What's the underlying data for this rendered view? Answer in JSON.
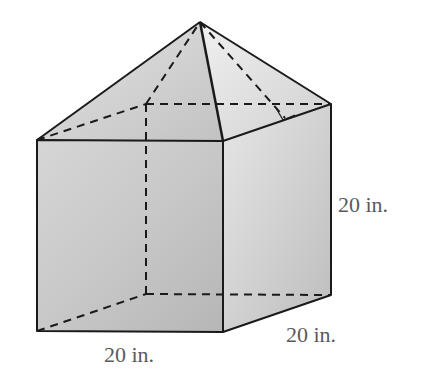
{
  "figure": {
    "labels": {
      "height": "20 in.",
      "depth": "20 in.",
      "width": "20 in."
    },
    "colors": {
      "edge": "#1a1a1a",
      "label": "#5a5a5a"
    },
    "annotations": [
      "right-angle-marker on pyramid slant height"
    ]
  }
}
